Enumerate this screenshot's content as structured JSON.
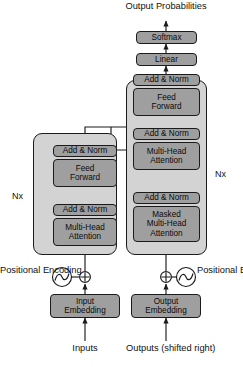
{
  "top": {
    "output_probabilities_line1": "Output",
    "output_probabilities_line2": "Probabilities",
    "softmax": "Softmax",
    "linear": "Linear"
  },
  "encoder": {
    "stack_label": "Nx",
    "blocks": {
      "add_norm_upper": "Add & Norm",
      "feed_forward_line1": "Feed",
      "feed_forward_line2": "Forward",
      "add_norm_lower": "Add & Norm",
      "attention_line1": "Multi-Head",
      "attention_line2": "Attention"
    }
  },
  "decoder": {
    "stack_label": "Nx",
    "blocks": {
      "add_norm_top": "Add & Norm",
      "feed_forward_line1": "Feed",
      "feed_forward_line2": "Forward",
      "add_norm_middle": "Add & Norm",
      "cross_attention_line1": "Multi-Head",
      "cross_attention_line2": "Attention",
      "add_norm_bottom": "Add & Norm",
      "masked_attention_line1": "Masked",
      "masked_attention_line2": "Multi-Head",
      "masked_attention_line3": "Attention"
    }
  },
  "inputs": {
    "positional_encoding_line1": "Positional",
    "positional_encoding_line2": "Encoding",
    "embedding_line1": "Input",
    "embedding_line2": "Embedding",
    "source_label": "Inputs",
    "add_symbol": "positional-sum-operator",
    "wave_symbol": "sine-wave-icon"
  },
  "outputs": {
    "positional_encoding_line1": "Positional",
    "positional_encoding_line2": "Encoding",
    "embedding_line1": "Output",
    "embedding_line2": "Embedding",
    "source_label_line1": "Outputs",
    "source_label_line2": "(shifted right)",
    "add_symbol": "positional-sum-operator",
    "wave_symbol": "sine-wave-icon"
  },
  "colors": {
    "outer_fill": "#d3d3d3",
    "block_fill": "#9f9f9f",
    "stroke": "#1b1b1b",
    "background": "#ffffff"
  }
}
